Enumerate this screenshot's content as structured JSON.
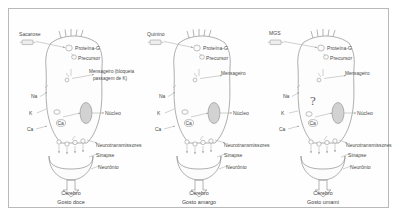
{
  "figure": {
    "panel_count": 3,
    "frame_color": "#b9b9b9",
    "line_color": "#8d8d8d",
    "text_color": "#4a4a4a"
  },
  "common_labels": {
    "protein_g": "Proteína-G",
    "precursor": "Precursor",
    "messenger": "Mensageiro",
    "nucleus": "Núcleo",
    "neurotransmitters": "Neurotransmissores",
    "synapse": "Sinapse",
    "neuron": "Neurônio",
    "brain": "Cérebro",
    "na": "Na",
    "k": "K",
    "ca": "Ca",
    "ca_internal": "Ca",
    "unknown": "?"
  },
  "panels": [
    {
      "id": "sweet",
      "stimulus": "Sacarose",
      "messenger_label": "Mensageiro (bloqueia",
      "messenger_label_line2": "passagem de K)",
      "protein_g": "Proteína-G",
      "precursor": "Precursor",
      "nucleus": "Núcleo",
      "neurotransmitters": "Neurotransmissores",
      "synapse": "Sinapse",
      "neuron": "Neurônio",
      "brain": "Cérebro",
      "caption": "Gosto doce",
      "na": "Na",
      "k": "K",
      "ca_outer": "Ca",
      "ca_inner": "Ca",
      "has_question_mark": false
    },
    {
      "id": "bitter",
      "stimulus": "Quinino",
      "messenger_label": "Mensageiro",
      "messenger_label_line2": "",
      "protein_g": "Proteína-G",
      "precursor": "Precursor",
      "nucleus": "Núcleo",
      "neurotransmitters": "Neurotransmissores",
      "synapse": "Sinapse",
      "neuron": "Neurônio",
      "brain": "Cérebro",
      "caption": "Gosto amargo",
      "na": "Na",
      "k": "K",
      "ca_outer": "Ca",
      "ca_inner": "Ca",
      "has_question_mark": false
    },
    {
      "id": "umami",
      "stimulus": "MGS",
      "messenger_label": "Mensageiro",
      "messenger_label_line2": "",
      "protein_g": "Proteína-G",
      "precursor": "Precursor",
      "nucleus": "Núcleo",
      "neurotransmitters": "Neurotransmissores",
      "synapse": "Sinapse",
      "neuron": "Neurônio",
      "brain": "Cérebro",
      "caption": "Gosto umami",
      "na": "Na",
      "k": "K",
      "ca_outer": "Ca",
      "ca_inner": "Ca",
      "has_question_mark": true,
      "question_mark": "?"
    }
  ]
}
